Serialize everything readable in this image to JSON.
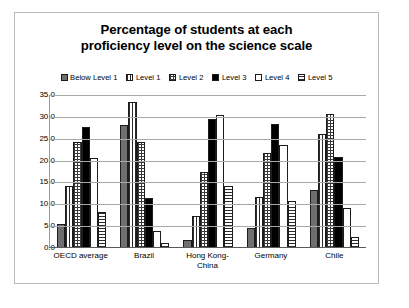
{
  "chart_data": {
    "type": "bar",
    "title": "Percentage of students at each proficiency level on the science scale",
    "title_lines": [
      "Percentage of students at each",
      "proficiency level on the science scale"
    ],
    "xlabel": "",
    "ylabel": "",
    "ylim": [
      0,
      35
    ],
    "ytick_labels": [
      "0.0",
      "5.0",
      "10.0",
      "15.0",
      "20.0",
      "25.0",
      "30.0",
      "35.0"
    ],
    "ytick_values": [
      0,
      5,
      10,
      15,
      20,
      25,
      30,
      35
    ],
    "grid": true,
    "legend_position": "top",
    "categories": [
      "OECD average",
      "Brazil",
      "Hong Kong-China",
      "Germany",
      "Chile"
    ],
    "category_label_lines": [
      [
        "OECD average"
      ],
      [
        "Brazil"
      ],
      [
        "Hong Kong-",
        "China"
      ],
      [
        "Germany"
      ],
      [
        "Chile"
      ]
    ],
    "series": [
      {
        "name": "Below Level 1",
        "pattern": "solid-gray",
        "values": [
          5.2,
          27.8,
          1.6,
          4.4,
          13.1
        ]
      },
      {
        "name": "Level 1",
        "pattern": "vertical-lines",
        "values": [
          14.0,
          33.1,
          7.2,
          11.4,
          25.9
        ]
      },
      {
        "name": "Level 2",
        "pattern": "dotted-grid",
        "values": [
          24.0,
          24.0,
          17.1,
          21.4,
          30.4
        ]
      },
      {
        "name": "Level 3",
        "pattern": "solid-black",
        "values": [
          27.4,
          11.2,
          29.2,
          28.1,
          20.5
        ]
      },
      {
        "name": "Level 4",
        "pattern": "white-empty",
        "values": [
          20.3,
          3.6,
          30.1,
          23.4,
          8.9
        ]
      },
      {
        "name": "Level 5",
        "pattern": "horizontal-lines",
        "values": [
          8.0,
          1.0,
          13.9,
          10.5,
          2.2
        ]
      }
    ]
  }
}
